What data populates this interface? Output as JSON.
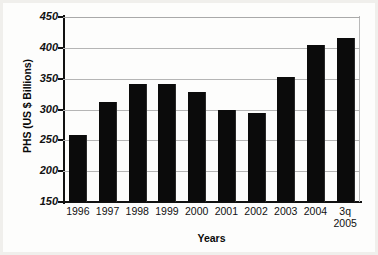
{
  "chart_data": {
    "type": "bar",
    "title": "",
    "xlabel": "Years",
    "ylabel": "PHS (US $ Billions)",
    "categories": [
      "1996",
      "1997",
      "1998",
      "1999",
      "2000",
      "2001",
      "2002",
      "2003",
      "2004",
      "3q 2005"
    ],
    "category_lines": [
      {
        "line1": "1996",
        "line2": ""
      },
      {
        "line1": "1997",
        "line2": ""
      },
      {
        "line1": "1998",
        "line2": ""
      },
      {
        "line1": "1999",
        "line2": ""
      },
      {
        "line1": "2000",
        "line2": ""
      },
      {
        "line1": "2001",
        "line2": ""
      },
      {
        "line1": "2002",
        "line2": ""
      },
      {
        "line1": "2003",
        "line2": ""
      },
      {
        "line1": "2004",
        "line2": ""
      },
      {
        "line1": "3q",
        "line2": "2005"
      }
    ],
    "values": [
      259,
      312,
      342,
      342,
      328,
      299,
      294,
      353,
      404,
      416
    ],
    "ylim": [
      150,
      450
    ],
    "yticks": [
      150,
      200,
      250,
      300,
      350,
      400,
      450
    ],
    "ytick_labels": [
      "150",
      "200",
      "250",
      "300",
      "350",
      "400",
      "450"
    ],
    "grid": true,
    "legend": "none",
    "bar_color": "#0b0b0b",
    "grid_color": "#b5b5b5",
    "axis_color": "#111111",
    "background": "#ffffff"
  }
}
